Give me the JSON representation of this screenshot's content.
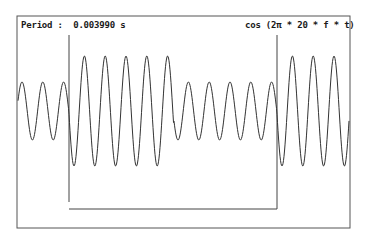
{
  "header": {
    "period_label": "Period :  0.003990 s",
    "formula_label": "cos (2π * 20 * f * t)"
  },
  "colors": {
    "background": "#ffffff",
    "trace": "#333333",
    "frame": "#555555"
  },
  "chart_data": {
    "type": "line",
    "title": "cos (2π * 20 * f * t)",
    "annotation": "Period : 0.003990 s",
    "xlabel": "",
    "ylabel": "",
    "grid": false,
    "legend": "none",
    "series": [
      {
        "name": "signal",
        "description": "cosine carrier with amplitude switched by a rectangular gate",
        "segments": [
          {
            "x_start_px": 17,
            "x_end_px": 69,
            "relative_amplitude": 0.53
          },
          {
            "x_start_px": 69,
            "x_end_px": 174,
            "relative_amplitude": 1.0
          },
          {
            "x_start_px": 174,
            "x_end_px": 277,
            "relative_amplitude": 0.53
          },
          {
            "x_start_px": 277,
            "x_end_px": 350,
            "relative_amplitude": 1.0
          }
        ],
        "cycles_visible": 16
      },
      {
        "name": "gate",
        "description": "rectangular gate marker: vertical at x=69 and x=277, low baseline between",
        "values": [
          1,
          0,
          0,
          1
        ]
      }
    ],
    "geometry": {
      "frame": {
        "left": 17,
        "top": 16,
        "right": 350,
        "bottom": 228
      },
      "center_y": 111,
      "period_px": 20.8,
      "small_amplitude_px": 29,
      "large_amplitude_px": 55,
      "gate": {
        "left_x": 69,
        "right_x": 277,
        "top_y": 35,
        "baseline_y": 209
      }
    }
  }
}
